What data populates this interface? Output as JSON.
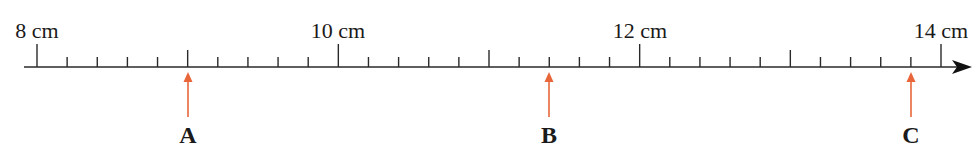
{
  "number_line": {
    "unit": "cm",
    "start": 8,
    "end": 14,
    "minor_step": 0.2,
    "labels": [
      {
        "value": 8,
        "text": "8 cm"
      },
      {
        "value": 10,
        "text": "10 cm"
      },
      {
        "value": 12,
        "text": "12 cm"
      },
      {
        "value": 14,
        "text": "14 cm"
      }
    ],
    "points": [
      {
        "name": "A",
        "value": 9.0
      },
      {
        "name": "B",
        "value": 11.4
      },
      {
        "name": "C",
        "value": 13.8
      }
    ],
    "colors": {
      "axis": "#2a2a2a",
      "marker": "#e8663a"
    }
  }
}
